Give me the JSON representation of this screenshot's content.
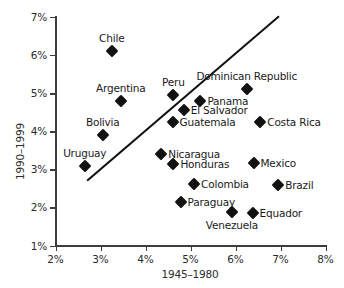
{
  "chart_data": {
    "type": "scatter",
    "title": "",
    "xlabel": "1945–1980",
    "ylabel": "1990–1999",
    "xlim": [
      2,
      8
    ],
    "ylim": [
      1,
      7
    ],
    "xticks": [
      "2%",
      "3%",
      "4%",
      "5%",
      "6%",
      "7%",
      "8%"
    ],
    "xtick_values": [
      2,
      3,
      4,
      5,
      6,
      7,
      8
    ],
    "yticks": [
      "1%",
      "2%",
      "3%",
      "4%",
      "5%",
      "6%",
      "7%"
    ],
    "ytick_values": [
      1,
      2,
      3,
      4,
      5,
      6,
      7
    ],
    "grid": false,
    "legend": "none",
    "marker_shape": "diamond",
    "marker_color": "#111111",
    "axis_color": "#3c3c3c",
    "points": [
      {
        "label": "Chile",
        "x": 3.25,
        "y": 6.1,
        "label_pos": "above"
      },
      {
        "label": "Argentina",
        "x": 3.45,
        "y": 4.8,
        "label_pos": "above"
      },
      {
        "label": "Bolivia",
        "x": 3.05,
        "y": 3.9,
        "label_pos": "above"
      },
      {
        "label": "Uruguay",
        "x": 2.65,
        "y": 3.1,
        "label_pos": "above"
      },
      {
        "label": "Peru",
        "x": 4.62,
        "y": 4.95,
        "label_pos": "above"
      },
      {
        "label": "Panama",
        "x": 5.22,
        "y": 4.8,
        "label_pos": "right"
      },
      {
        "label": "El Salvador",
        "x": 4.85,
        "y": 4.55,
        "label_pos": "right"
      },
      {
        "label": "Guatemala",
        "x": 4.6,
        "y": 4.25,
        "label_pos": "right"
      },
      {
        "label": "Dominican Republic",
        "x": 6.25,
        "y": 5.1,
        "label_pos": "above"
      },
      {
        "label": "Costa Rica",
        "x": 6.55,
        "y": 4.25,
        "label_pos": "right"
      },
      {
        "label": "Nicaragua",
        "x": 4.35,
        "y": 3.4,
        "label_pos": "right"
      },
      {
        "label": "Honduras",
        "x": 4.62,
        "y": 3.13,
        "label_pos": "right"
      },
      {
        "label": "Mexico",
        "x": 6.4,
        "y": 3.17,
        "label_pos": "right"
      },
      {
        "label": "Colombia",
        "x": 5.08,
        "y": 2.62,
        "label_pos": "right"
      },
      {
        "label": "Brazil",
        "x": 6.95,
        "y": 2.58,
        "label_pos": "right"
      },
      {
        "label": "Paraguay",
        "x": 4.78,
        "y": 2.13,
        "label_pos": "right"
      },
      {
        "label": "Venezuela",
        "x": 5.92,
        "y": 1.88,
        "label_pos": "below"
      },
      {
        "label": "Equador",
        "x": 6.38,
        "y": 1.85,
        "label_pos": "right"
      }
    ],
    "trend_line": {
      "x0": 2.72,
      "y0": 2.72,
      "x1": 6.95,
      "y1": 7.0,
      "color": "#111111",
      "width_px": 2
    }
  }
}
